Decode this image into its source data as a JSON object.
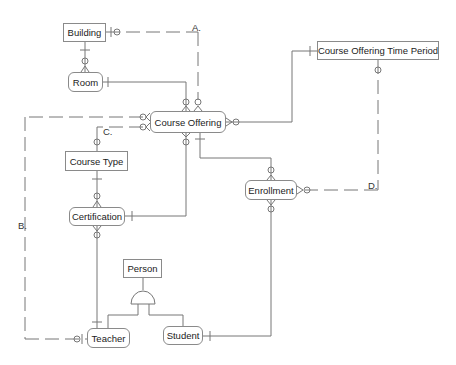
{
  "diagram": {
    "type": "ER diagram (crow's foot notation)",
    "entities": [
      {
        "id": "building",
        "label": "Building",
        "shape": "rectangle"
      },
      {
        "id": "room",
        "label": "Room",
        "shape": "rounded"
      },
      {
        "id": "course_offering",
        "label": "Course Offering",
        "shape": "rounded"
      },
      {
        "id": "course_offering_time_period",
        "label": "Course Offering Time Period",
        "shape": "rectangle"
      },
      {
        "id": "course_type",
        "label": "Course Type",
        "shape": "rectangle"
      },
      {
        "id": "certification",
        "label": "Certification",
        "shape": "rounded"
      },
      {
        "id": "enrollment",
        "label": "Enrollment",
        "shape": "rounded"
      },
      {
        "id": "person",
        "label": "Person",
        "shape": "rectangle"
      },
      {
        "id": "teacher",
        "label": "Teacher",
        "shape": "rounded"
      },
      {
        "id": "student",
        "label": "Student",
        "shape": "rounded"
      }
    ],
    "annotations": {
      "a": "A.",
      "b": "B.",
      "c": "C.",
      "d": "D."
    },
    "relationships": [
      {
        "from": "building",
        "to": "room",
        "style": "solid"
      },
      {
        "from": "building",
        "to": "course_offering",
        "style": "dashed",
        "label": "A."
      },
      {
        "from": "room",
        "to": "course_offering",
        "style": "solid"
      },
      {
        "from": "course_offering",
        "to": "course_offering_time_period",
        "style": "solid"
      },
      {
        "from": "course_offering_time_period",
        "to": "enrollment",
        "style": "dashed",
        "label": "D."
      },
      {
        "from": "course_offering",
        "to": "teacher",
        "style": "dashed",
        "label": "B."
      },
      {
        "from": "course_offering",
        "to": "course_type",
        "style": "dashed",
        "label": "C."
      },
      {
        "from": "course_type",
        "to": "certification",
        "style": "solid"
      },
      {
        "from": "certification",
        "to": "course_offering",
        "style": "solid"
      },
      {
        "from": "course_offering",
        "to": "enrollment",
        "style": "solid"
      },
      {
        "from": "certification",
        "to": "teacher",
        "style": "solid"
      },
      {
        "from": "enrollment",
        "to": "student",
        "style": "solid"
      },
      {
        "from": "person",
        "to": "teacher",
        "style": "subtype"
      },
      {
        "from": "person",
        "to": "student",
        "style": "subtype"
      }
    ]
  }
}
